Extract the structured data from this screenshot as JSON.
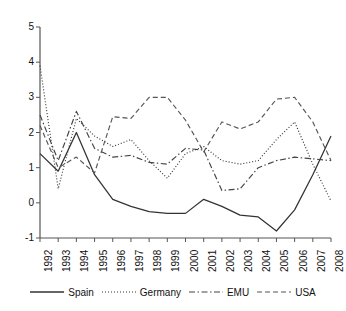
{
  "chart_data": {
    "type": "line",
    "title": "",
    "xlabel": "",
    "ylabel": "",
    "xlim": [
      1992,
      2008
    ],
    "ylim": [
      -1,
      5
    ],
    "yticks": [
      -1,
      0,
      1,
      2,
      3,
      4,
      5
    ],
    "grid": false,
    "legend_position": "bottom",
    "categories": [
      "1992",
      "1993",
      "1994",
      "1995",
      "1996",
      "1997",
      "1998",
      "1999",
      "2000",
      "2001",
      "2002",
      "2003",
      "2004",
      "2005",
      "2006",
      "2007",
      "2008"
    ],
    "x": [
      1992,
      1993,
      1994,
      1995,
      1996,
      1997,
      1998,
      1999,
      2000,
      2001,
      2002,
      2003,
      2004,
      2005,
      2006,
      2007,
      2008
    ],
    "series": [
      {
        "name": "Spain",
        "style": "solid",
        "color": "#333333",
        "values": [
          1.4,
          0.9,
          2.0,
          0.8,
          0.1,
          -0.1,
          -0.25,
          -0.3,
          -0.3,
          0.1,
          -0.1,
          -0.35,
          -0.4,
          -0.8,
          -0.2,
          0.8,
          1.9
        ]
      },
      {
        "name": "Germany",
        "style": "dotted",
        "color": "#333333",
        "values": [
          3.9,
          0.4,
          2.4,
          1.9,
          1.6,
          1.8,
          1.2,
          0.7,
          1.4,
          1.6,
          1.2,
          1.1,
          1.2,
          1.8,
          2.3,
          1.1,
          0.05
        ]
      },
      {
        "name": "EMU",
        "style": "dashdot",
        "color": "#444444",
        "values": [
          2.5,
          1.2,
          2.6,
          1.55,
          1.3,
          1.35,
          1.15,
          1.1,
          1.55,
          1.5,
          0.35,
          0.4,
          1.0,
          1.2,
          1.3,
          1.25,
          1.2
        ]
      },
      {
        "name": "USA",
        "style": "dashed",
        "color": "#555555",
        "values": [
          2.2,
          1.0,
          1.3,
          0.85,
          2.45,
          2.4,
          3.0,
          3.0,
          2.35,
          1.45,
          2.3,
          2.1,
          2.3,
          2.95,
          3.0,
          2.3,
          1.2
        ]
      }
    ]
  },
  "axes": {
    "y_tick_labels": [
      "5",
      "4",
      "3",
      "2",
      "1",
      "0",
      "-1"
    ],
    "x_tick_labels": [
      "1992",
      "1993",
      "1994",
      "1995",
      "1996",
      "1997",
      "1998",
      "1999",
      "2000",
      "2001",
      "2002",
      "2003",
      "2004",
      "2005",
      "2006",
      "2007",
      "2008"
    ]
  },
  "legend": {
    "items": [
      {
        "label": "Spain",
        "style": "solid"
      },
      {
        "label": "Germany",
        "style": "dotted"
      },
      {
        "label": "EMU",
        "style": "dashdot"
      },
      {
        "label": "USA",
        "style": "dashed"
      }
    ]
  }
}
